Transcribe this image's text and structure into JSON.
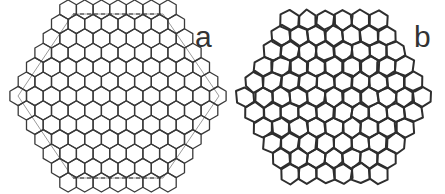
{
  "figure": {
    "panels": [
      {
        "label": "a",
        "description": "Regular honeycomb lattice inside a hexagonal boundary with dashed top and bottom edges",
        "stroke_color": "#3a3a3a",
        "boundary_color": "#9a9a9a"
      },
      {
        "label": "b",
        "description": "Relaxed/distorted honeycomb lattice with irregular boundary cells",
        "stroke_color": "#2e2e2e"
      }
    ]
  }
}
